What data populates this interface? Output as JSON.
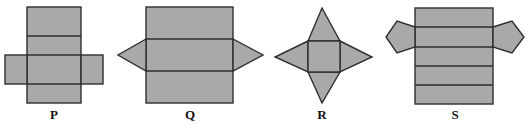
{
  "figure": {
    "nets": [
      {
        "id": "P",
        "label": "P",
        "shape": "cross-shaped net of six rectangles (cuboid)"
      },
      {
        "id": "Q",
        "label": "Q",
        "shape": "three rectangles with two triangles (triangular prism)"
      },
      {
        "id": "R",
        "label": "R",
        "shape": "square with four triangles (square pyramid)"
      },
      {
        "id": "S",
        "label": "S",
        "shape": "five rectangles with two pentagons (pentagonal prism)"
      }
    ]
  },
  "colors": {
    "face_fill": "#a9a9a9",
    "edge": "#2e2e2e",
    "background": "#ffffff"
  }
}
